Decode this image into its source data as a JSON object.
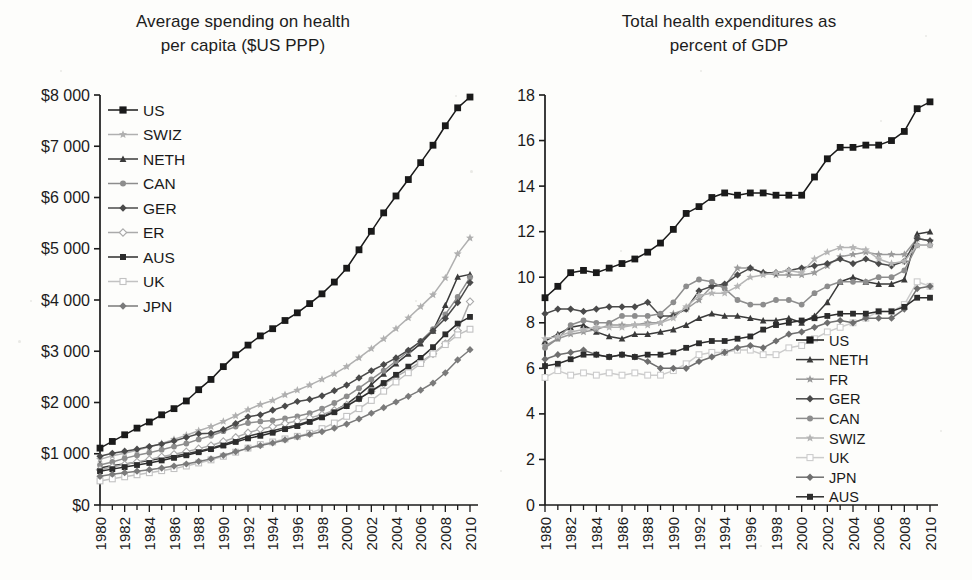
{
  "figure": {
    "background": "#fdfdfb",
    "ink": "#1a1a1a"
  },
  "left_panel": {
    "title": "Average spending on health\nper capita ($US PPP)",
    "legend_title": "",
    "y_ticks": [
      "$0",
      "$1 000",
      "$2 000",
      "$3 000",
      "$4 000",
      "$5 000",
      "$6 000",
      "$7 000",
      "$8 000"
    ],
    "x_ticks": [
      "1980",
      "1982",
      "1984",
      "1986",
      "1988",
      "1990",
      "1992",
      "1994",
      "1996",
      "1998",
      "2000",
      "2002",
      "2004",
      "2006",
      "2008",
      "2010"
    ]
  },
  "right_panel": {
    "title": "Total health expenditures as\npercent of GDP",
    "y_ticks": [
      "0",
      "2",
      "4",
      "6",
      "8",
      "10",
      "12",
      "14",
      "16",
      "18"
    ],
    "x_ticks": [
      "1980",
      "1982",
      "1984",
      "1986",
      "1988",
      "1990",
      "1992",
      "1994",
      "1996",
      "1998",
      "2000",
      "2002",
      "2004",
      "2006",
      "2008",
      "2010"
    ]
  },
  "chart_data": [
    {
      "type": "line",
      "id": "spending-per-capita",
      "title": "Average spending on health per capita ($US PPP)",
      "xlabel": "",
      "ylabel": "$US PPP per capita",
      "xlim": [
        1980,
        2010
      ],
      "ylim": [
        0,
        8000
      ],
      "ytick_step": 1000,
      "xtick_step": 2,
      "grid": false,
      "legend_position": "upper-left-inside",
      "x": [
        1980,
        1981,
        1982,
        1983,
        1984,
        1985,
        1986,
        1987,
        1988,
        1989,
        1990,
        1991,
        1992,
        1993,
        1994,
        1995,
        1996,
        1997,
        1998,
        1999,
        2000,
        2001,
        2002,
        2003,
        2004,
        2005,
        2006,
        2007,
        2008,
        2009,
        2010
      ],
      "series": [
        {
          "name": "US",
          "marker": "square",
          "color": "#1a1a1a",
          "values": [
            1110,
            1240,
            1370,
            1500,
            1620,
            1760,
            1880,
            2030,
            2250,
            2450,
            2700,
            2930,
            3120,
            3300,
            3440,
            3600,
            3750,
            3930,
            4120,
            4350,
            4620,
            4980,
            5340,
            5700,
            6030,
            6350,
            6680,
            7020,
            7400,
            7750,
            7960
          ]
        },
        {
          "name": "SWIZ",
          "marker": "star",
          "color": "#b0b0b0",
          "values": [
            890,
            960,
            1010,
            1070,
            1130,
            1200,
            1280,
            1360,
            1450,
            1530,
            1630,
            1740,
            1860,
            1960,
            2040,
            2150,
            2240,
            2340,
            2450,
            2560,
            2700,
            2870,
            3050,
            3240,
            3440,
            3650,
            3870,
            4100,
            4430,
            4900,
            5210
          ]
        },
        {
          "name": "NETH",
          "marker": "triangle",
          "color": "#3a3a3a",
          "values": [
            720,
            770,
            800,
            830,
            870,
            910,
            950,
            1000,
            1050,
            1110,
            1180,
            1260,
            1340,
            1400,
            1450,
            1510,
            1560,
            1640,
            1730,
            1840,
            1970,
            2150,
            2350,
            2560,
            2760,
            2950,
            3150,
            3400,
            3900,
            4450,
            4500
          ]
        },
        {
          "name": "CAN",
          "marker": "circle",
          "color": "#8d8d8d",
          "values": [
            780,
            840,
            910,
            970,
            1020,
            1080,
            1140,
            1200,
            1280,
            1350,
            1440,
            1530,
            1600,
            1630,
            1650,
            1690,
            1730,
            1790,
            1880,
            1990,
            2120,
            2280,
            2450,
            2620,
            2810,
            3000,
            3200,
            3430,
            3720,
            4060,
            4440
          ]
        },
        {
          "name": "GER",
          "marker": "diamond",
          "color": "#4a4a4a",
          "values": [
            950,
            1010,
            1050,
            1090,
            1140,
            1190,
            1250,
            1320,
            1390,
            1400,
            1470,
            1590,
            1720,
            1760,
            1850,
            1930,
            2020,
            2060,
            2130,
            2230,
            2340,
            2480,
            2620,
            2740,
            2870,
            3020,
            3190,
            3400,
            3640,
            3950,
            4340
          ]
        },
        {
          "name": "ER",
          "marker": "diamond-open",
          "color": "#aaaaaa",
          "values": [
            690,
            740,
            790,
            840,
            890,
            940,
            990,
            1040,
            1100,
            1160,
            1240,
            1320,
            1410,
            1480,
            1530,
            1590,
            1640,
            1700,
            1760,
            1850,
            1950,
            2080,
            2220,
            2360,
            2500,
            2640,
            2790,
            2950,
            3150,
            3400,
            3970
          ]
        },
        {
          "name": "AUS",
          "marker": "square",
          "color": "#2c2c2c",
          "values": [
            660,
            700,
            740,
            780,
            820,
            870,
            920,
            970,
            1030,
            1090,
            1160,
            1230,
            1300,
            1350,
            1410,
            1480,
            1540,
            1620,
            1710,
            1810,
            1930,
            2070,
            2220,
            2380,
            2540,
            2700,
            2870,
            3080,
            3330,
            3540,
            3670
          ]
        },
        {
          "name": "UK",
          "marker": "square-open",
          "color": "#c2c2c2",
          "values": [
            470,
            510,
            550,
            590,
            630,
            670,
            710,
            760,
            820,
            880,
            950,
            1030,
            1110,
            1180,
            1230,
            1290,
            1340,
            1400,
            1490,
            1600,
            1730,
            1880,
            2040,
            2220,
            2400,
            2580,
            2760,
            2950,
            3130,
            3320,
            3430
          ]
        },
        {
          "name": "JPN",
          "marker": "diamond",
          "color": "#7a7a7a",
          "values": [
            560,
            600,
            630,
            660,
            690,
            720,
            760,
            800,
            850,
            900,
            970,
            1040,
            1110,
            1160,
            1210,
            1270,
            1330,
            1380,
            1430,
            1500,
            1580,
            1680,
            1790,
            1900,
            2010,
            2120,
            2240,
            2380,
            2580,
            2830,
            3030
          ]
        }
      ]
    },
    {
      "type": "line",
      "id": "health-expenditure-pct-gdp",
      "title": "Total health expenditures as percent of GDP",
      "xlabel": "",
      "ylabel": "Percent of GDP",
      "xlim": [
        1980,
        2010
      ],
      "ylim": [
        0,
        18
      ],
      "ytick_step": 2,
      "xtick_step": 2,
      "grid": false,
      "legend_position": "lower-right-inside",
      "x": [
        1980,
        1981,
        1982,
        1983,
        1984,
        1985,
        1986,
        1987,
        1988,
        1989,
        1990,
        1991,
        1992,
        1993,
        1994,
        1995,
        1996,
        1997,
        1998,
        1999,
        2000,
        2001,
        2002,
        2003,
        2004,
        2005,
        2006,
        2007,
        2008,
        2009,
        2010
      ],
      "series": [
        {
          "name": "US",
          "marker": "square",
          "color": "#1a1a1a",
          "values": [
            9.1,
            9.6,
            10.2,
            10.3,
            10.2,
            10.4,
            10.6,
            10.8,
            11.1,
            11.5,
            12.1,
            12.8,
            13.1,
            13.5,
            13.7,
            13.6,
            13.7,
            13.7,
            13.6,
            13.6,
            13.6,
            14.4,
            15.2,
            15.7,
            15.7,
            15.8,
            15.8,
            16.0,
            16.4,
            17.4,
            17.7
          ]
        },
        {
          "name": "NETH",
          "marker": "triangle",
          "color": "#3a3a3a",
          "values": [
            7.2,
            7.5,
            7.8,
            7.9,
            7.6,
            7.4,
            7.3,
            7.5,
            7.5,
            7.6,
            7.7,
            7.9,
            8.2,
            8.4,
            8.3,
            8.3,
            8.2,
            8.1,
            8.1,
            8.2,
            8.0,
            8.3,
            8.9,
            9.8,
            10.0,
            9.8,
            9.7,
            9.7,
            9.9,
            11.9,
            12.0
          ]
        },
        {
          "name": "FR",
          "marker": "star",
          "color": "#9a9a9a",
          "values": [
            7.0,
            7.3,
            7.5,
            7.6,
            7.7,
            7.9,
            7.9,
            7.9,
            8.0,
            8.0,
            8.4,
            8.6,
            9.0,
            9.6,
            9.6,
            10.4,
            10.4,
            10.2,
            10.1,
            10.1,
            10.1,
            10.2,
            10.5,
            10.9,
            11.0,
            11.1,
            11.0,
            11.0,
            11.0,
            11.7,
            11.6
          ]
        },
        {
          "name": "GER",
          "marker": "diamond",
          "color": "#4a4a4a",
          "values": [
            8.4,
            8.6,
            8.6,
            8.5,
            8.6,
            8.7,
            8.7,
            8.7,
            8.9,
            8.3,
            8.3,
            8.6,
            9.4,
            9.6,
            9.7,
            10.1,
            10.4,
            10.2,
            10.2,
            10.3,
            10.4,
            10.5,
            10.6,
            10.8,
            10.6,
            10.8,
            10.6,
            10.5,
            10.7,
            11.7,
            11.6
          ]
        },
        {
          "name": "CAN",
          "marker": "circle",
          "color": "#8d8d8d",
          "values": [
            6.9,
            7.3,
            7.9,
            8.1,
            8.0,
            8.0,
            8.3,
            8.3,
            8.3,
            8.4,
            8.9,
            9.6,
            9.9,
            9.8,
            9.5,
            9.0,
            8.8,
            8.8,
            9.0,
            9.0,
            8.8,
            9.3,
            9.6,
            9.8,
            9.8,
            9.8,
            10.0,
            10.0,
            10.3,
            11.4,
            11.4
          ]
        },
        {
          "name": "SWIZ",
          "marker": "star",
          "color": "#b5b5b5",
          "values": [
            7.3,
            7.4,
            7.6,
            7.7,
            7.8,
            7.8,
            7.8,
            7.9,
            7.9,
            8.0,
            8.2,
            8.7,
            9.2,
            9.3,
            9.3,
            9.6,
            10.0,
            10.1,
            10.2,
            10.3,
            10.2,
            10.8,
            11.1,
            11.3,
            11.3,
            11.2,
            10.8,
            10.6,
            10.7,
            11.4,
            11.4
          ]
        },
        {
          "name": "UK",
          "marker": "square-open",
          "color": "#cccccc",
          "values": [
            5.6,
            5.9,
            5.7,
            5.8,
            5.7,
            5.8,
            5.7,
            5.8,
            5.7,
            5.7,
            5.9,
            6.2,
            6.6,
            6.7,
            6.7,
            6.8,
            6.8,
            6.6,
            6.6,
            6.9,
            7.0,
            7.3,
            7.6,
            7.8,
            8.0,
            8.2,
            8.5,
            8.5,
            8.8,
            9.8,
            9.6
          ]
        },
        {
          "name": "JPN",
          "marker": "diamond",
          "color": "#6e6e6e",
          "values": [
            6.4,
            6.6,
            6.7,
            6.8,
            6.6,
            6.5,
            6.6,
            6.5,
            6.3,
            6.0,
            6.0,
            6.0,
            6.3,
            6.5,
            6.7,
            6.9,
            7.0,
            6.9,
            7.2,
            7.5,
            7.6,
            7.8,
            8.0,
            8.1,
            8.0,
            8.2,
            8.2,
            8.2,
            8.6,
            9.5,
            9.6
          ]
        },
        {
          "name": "AUS",
          "marker": "square",
          "color": "#2c2c2c",
          "values": [
            6.1,
            6.2,
            6.4,
            6.6,
            6.6,
            6.5,
            6.6,
            6.5,
            6.6,
            6.6,
            6.7,
            6.9,
            7.1,
            7.2,
            7.2,
            7.3,
            7.4,
            7.7,
            7.9,
            8.0,
            8.1,
            8.2,
            8.3,
            8.4,
            8.4,
            8.4,
            8.5,
            8.5,
            8.7,
            9.1,
            9.1
          ]
        }
      ]
    }
  ]
}
